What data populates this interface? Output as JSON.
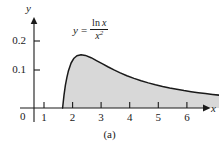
{
  "figure": {
    "caption": "(a)",
    "origin_label": "0"
  },
  "equation": {
    "lhs": "y",
    "equals": "=",
    "numerator_fn": "ln",
    "numerator_var": "x",
    "denominator_var": "x",
    "denominator_exponent": "2",
    "plain": "y = ln x / x^2"
  },
  "chart_data": {
    "type": "area",
    "title": "",
    "subtitle": "",
    "xlabel": "x",
    "ylabel": "y",
    "annotation": "y = ln x / x^2",
    "grid": false,
    "legend": null,
    "xlim": [
      0,
      7.1
    ],
    "ylim": [
      0,
      0.235
    ],
    "xticks": [
      1,
      2,
      3,
      4,
      5,
      6
    ],
    "xtick_labels": [
      "1",
      "2",
      "3",
      "4",
      "5",
      "6"
    ],
    "yticks": [
      0.1,
      0.2
    ],
    "ytick_labels": [
      "0.1",
      "0.2"
    ],
    "fill_domain": [
      1,
      6.8
    ],
    "peak": {
      "x": 1.65,
      "y": 0.184
    },
    "x": [
      1.0,
      1.05,
      1.1,
      1.15,
      1.2,
      1.3,
      1.4,
      1.5,
      1.65,
      1.8,
      2.0,
      2.2,
      2.4,
      2.6,
      2.8,
      3.0,
      3.25,
      3.5,
      3.75,
      4.0,
      4.25,
      4.5,
      4.75,
      5.0,
      5.25,
      5.5,
      5.75,
      6.0,
      6.25,
      6.5,
      6.8
    ],
    "y": [
      0.0,
      0.0442,
      0.0788,
      0.1057,
      0.1266,
      0.1552,
      0.1716,
      0.1803,
      0.1839,
      0.1814,
      0.1733,
      0.1628,
      0.1519,
      0.1413,
      0.1313,
      0.1221,
      0.1115,
      0.1022,
      0.0939,
      0.0866,
      0.0801,
      0.0743,
      0.0691,
      0.0644,
      0.0601,
      0.0563,
      0.0528,
      0.0498,
      0.0469,
      0.0443,
      0.0415
    ],
    "colors": {
      "fill": "#d8d8d8",
      "curve": "#1a1a1a",
      "axis": "#1a1a1a",
      "background": "#ffffff"
    }
  }
}
